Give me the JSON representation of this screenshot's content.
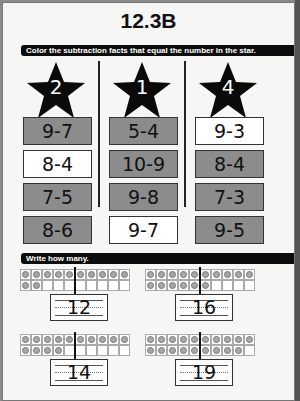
{
  "title": "12.3B",
  "section1": {
    "instruction": "Color the subtraction facts that equal the number in the star.",
    "columns": [
      {
        "star": "2",
        "facts": [
          {
            "text": "9-7",
            "shaded": true
          },
          {
            "text": "8-4",
            "shaded": false
          },
          {
            "text": "7-5",
            "shaded": true
          },
          {
            "text": "8-6",
            "shaded": true
          }
        ]
      },
      {
        "star": "1",
        "facts": [
          {
            "text": "5-4",
            "shaded": true
          },
          {
            "text": "10-9",
            "shaded": true
          },
          {
            "text": "9-8",
            "shaded": true
          },
          {
            "text": "9-7",
            "shaded": false
          }
        ]
      },
      {
        "star": "4",
        "facts": [
          {
            "text": "9-3",
            "shaded": false
          },
          {
            "text": "8-4",
            "shaded": true
          },
          {
            "text": "7-3",
            "shaded": true
          },
          {
            "text": "9-5",
            "shaded": true
          }
        ]
      }
    ]
  },
  "section2": {
    "instruction": "Write how many.",
    "items": [
      {
        "count": 12,
        "answer": "12"
      },
      {
        "count": 16,
        "answer": "16"
      },
      {
        "count": 14,
        "answer": "14"
      },
      {
        "count": 19,
        "answer": "19"
      }
    ]
  },
  "colors": {
    "shaded": "#8c8c8c",
    "header_bar": "#0d0d0d",
    "star": "#0a0a0a"
  }
}
